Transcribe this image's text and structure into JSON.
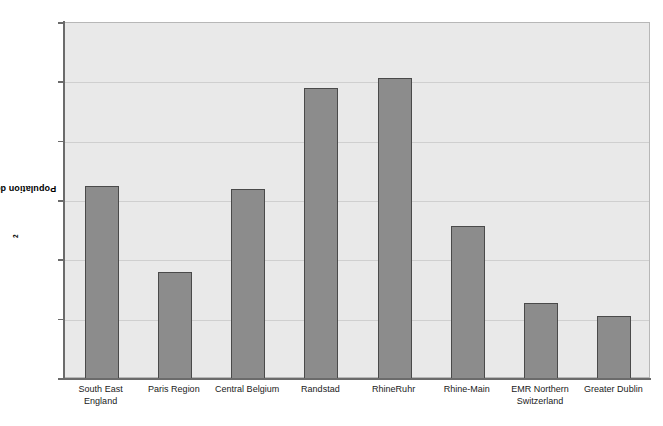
{
  "chart_data": {
    "type": "bar",
    "title": "",
    "xlabel": "",
    "ylabel": "Population density/km",
    "ylabel_superscript": "2",
    "ylim": [
      0,
      1200
    ],
    "ytick_step": 200,
    "yticks": [
      "1200",
      "1000",
      "800",
      "600",
      "400",
      "200",
      "0"
    ],
    "grid": true,
    "legend": "none",
    "categories": [
      "South East\nEngland",
      "Paris Region",
      "Central Belgium",
      "Randstad",
      "RhineRuhr",
      "Rhine-Main",
      "EMR Northern\nSwitzerland",
      "Greater Dublin"
    ],
    "values": [
      650,
      360,
      640,
      980,
      1015,
      515,
      255,
      213
    ],
    "colors": {
      "bar_fill": "#8c8c8c",
      "bar_border": "#4a4a4a",
      "plot_background": "#e9e9e9",
      "gridline": "#cfcfcf",
      "axis": "#6b6b6b",
      "text": "#1a1a1a",
      "page_background": "#ffffff"
    }
  }
}
